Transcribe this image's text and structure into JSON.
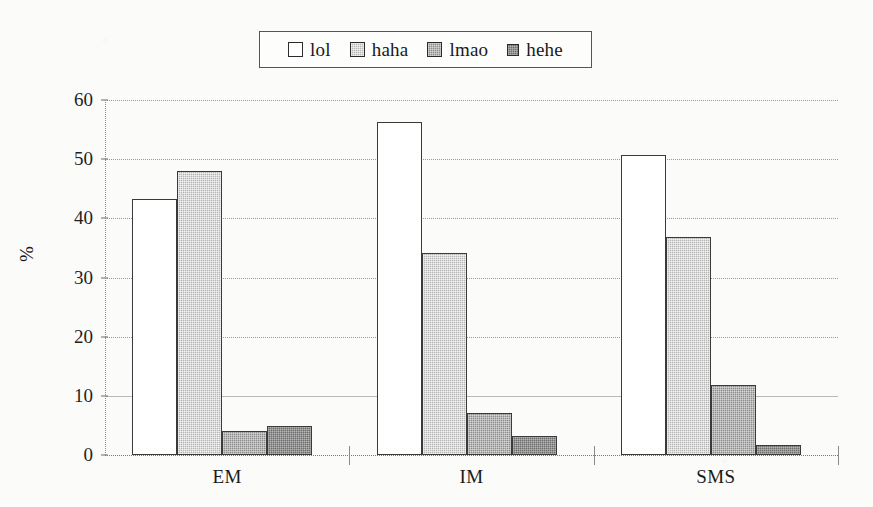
{
  "chart_data": {
    "type": "bar",
    "title": "",
    "subtitle": "",
    "xlabel": "",
    "ylabel": "%",
    "categories": [
      "EM",
      "IM",
      "SMS"
    ],
    "series": [
      {
        "name": "lol",
        "values": [
          43.3,
          56.3,
          50.7
        ],
        "swatch": "white",
        "color": "#ffffff"
      },
      {
        "name": "haha",
        "values": [
          48.0,
          34.1,
          36.9
        ],
        "swatch": "light-gray",
        "color": "#b5b5b5"
      },
      {
        "name": "lmao",
        "values": [
          4.1,
          7.1,
          11.8
        ],
        "swatch": "mid-gray",
        "color": "#8d8d8d"
      },
      {
        "name": "hehe",
        "values": [
          4.9,
          3.2,
          1.7
        ],
        "swatch": "dark-gray",
        "color": "#6d6d6d"
      }
    ],
    "ylim": [
      0,
      60
    ],
    "yticks": [
      0,
      10,
      20,
      30,
      40,
      50,
      60
    ],
    "ytick_labels": [
      "0",
      "10",
      "20",
      "30",
      "40",
      "50",
      "60"
    ],
    "grid": true,
    "grid_style": "dotted",
    "legend_position": "top-center",
    "bar_border_color": "#3a3a3a",
    "background_color": "#fbfbf9",
    "text_color": "#1a1a1a"
  },
  "legend": {
    "items": [
      {
        "label": "lol"
      },
      {
        "label": "haha"
      },
      {
        "label": "lmao"
      },
      {
        "label": "hehe"
      }
    ]
  }
}
